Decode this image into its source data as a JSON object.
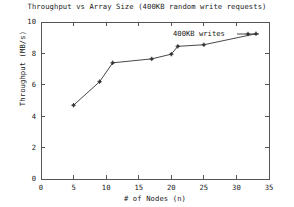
{
  "chart_data": {
    "type": "line",
    "title": "Throughput vs Array Size (400KB random write requests)",
    "xlabel": "# of Nodes (n)",
    "ylabel": "Throughput (MB/s)",
    "xlim": [
      0,
      35
    ],
    "ylim": [
      0,
      10
    ],
    "xticks": [
      0,
      5,
      10,
      15,
      20,
      25,
      30,
      35
    ],
    "yticks": [
      0,
      2,
      4,
      6,
      8,
      10
    ],
    "xtick_labels": [
      "0",
      "5",
      "10",
      "15",
      "20",
      "25",
      "30",
      "35"
    ],
    "ytick_labels": [
      "0",
      "2",
      "4",
      "6",
      "8",
      "10"
    ],
    "grid": false,
    "legend_position": "top-right",
    "series": [
      {
        "name": "400KB writes",
        "marker": "plus-diamond",
        "color": "#333333",
        "x": [
          5,
          9,
          11,
          17,
          20,
          21,
          25,
          33
        ],
        "y": [
          4.7,
          6.2,
          7.4,
          7.65,
          7.95,
          8.45,
          8.55,
          9.25
        ]
      }
    ]
  },
  "legend": {
    "entries": [
      {
        "label": "400KB writes"
      }
    ]
  },
  "axes": {
    "frame_color": "#555555"
  }
}
